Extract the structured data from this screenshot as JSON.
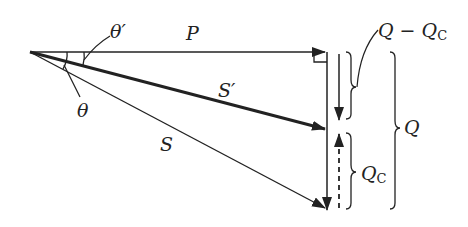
{
  "diagram": {
    "type": "power-triangle-phasor",
    "labels": {
      "theta_prime": "θ′",
      "theta": "θ",
      "P": "P",
      "S_prime": "S′",
      "S": "S",
      "Q_minus_Qc_main": "Q − Q",
      "Q_minus_Qc_sub": "C",
      "Qc_main": "Q",
      "Qc_sub": "C",
      "Q": "Q"
    },
    "colors": {
      "stroke": "#222222",
      "background": "#ffffff"
    }
  }
}
